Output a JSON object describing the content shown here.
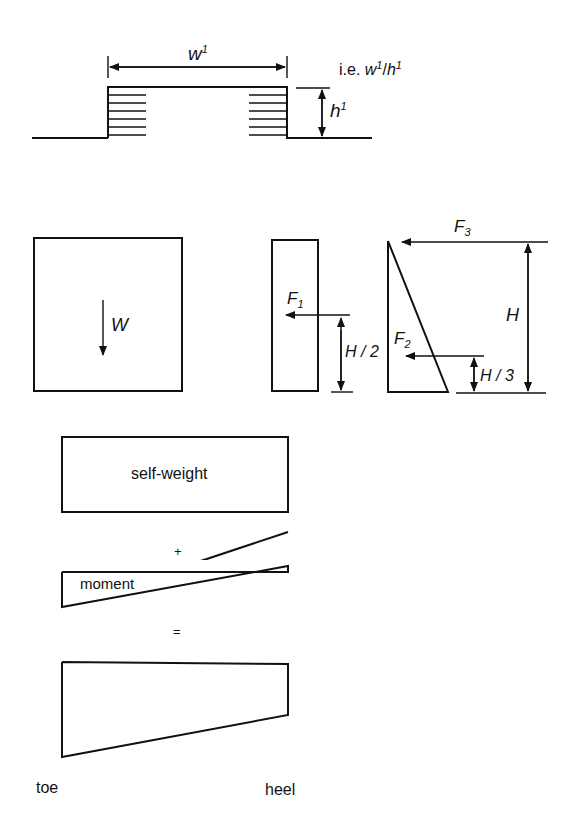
{
  "top": {
    "width_label": "w",
    "width_sup": "1",
    "height_label": "h",
    "height_sup": "1",
    "ratio_prefix": "i.e. ",
    "ratio_w": "w",
    "ratio_w_sup": "1",
    "ratio_sep": "/",
    "ratio_h": "h",
    "ratio_h_sup": "1"
  },
  "forces": {
    "weight_label": "W",
    "f1_label": "F",
    "f1_sub": "1",
    "f1_height": "H / 2",
    "f2_label": "F",
    "f2_sub": "2",
    "f2_height": "H / 3",
    "f3_label": "F",
    "f3_sub": "3",
    "total_height": "H"
  },
  "pressure": {
    "self_weight_label": "self-weight",
    "plus_label": "+",
    "moment_label": "moment",
    "equals_label": "=",
    "toe_label": "toe",
    "heel_label": "heel"
  }
}
